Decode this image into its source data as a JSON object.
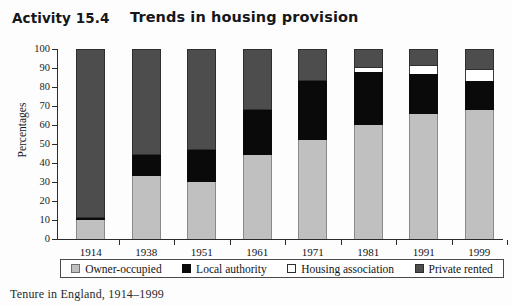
{
  "header": {
    "activity_label": "Activity 15.4",
    "title": "Trends in housing provision"
  },
  "caption": "Tenure in England, 1914–1999",
  "legend": {
    "items": [
      {
        "label": "Owner-occupied",
        "color": "#c0c0c0",
        "key": "owner"
      },
      {
        "label": "Local authority",
        "color": "#0a0a0a",
        "key": "local"
      },
      {
        "label": "Housing association",
        "color": "#ffffff",
        "key": "housing"
      },
      {
        "label": "Private rented",
        "color": "#4d4d4d",
        "key": "private"
      }
    ]
  },
  "chart_data": {
    "type": "bar",
    "stacked": true,
    "title": "Trends in housing provision",
    "xlabel": "",
    "ylabel": "Percentages",
    "ylim": [
      0,
      100
    ],
    "yticks": [
      0,
      10,
      20,
      30,
      40,
      50,
      60,
      70,
      80,
      90,
      100
    ],
    "grid": false,
    "legend_position": "bottom",
    "categories": [
      "1914",
      "1938",
      "1951",
      "1961",
      "1971",
      "1981",
      "1991",
      "1999"
    ],
    "series": [
      {
        "name": "Owner-occupied",
        "color": "#c0c0c0",
        "values": [
          10,
          33,
          30,
          44,
          52,
          60,
          66,
          68
        ]
      },
      {
        "name": "Local authority",
        "color": "#0a0a0a",
        "values": [
          1,
          11,
          17,
          24,
          31,
          28,
          21,
          15
        ]
      },
      {
        "name": "Housing association",
        "color": "#ffffff",
        "values": [
          0,
          0,
          0,
          0,
          0,
          2,
          4,
          6
        ]
      },
      {
        "name": "Private rented",
        "color": "#4d4d4d",
        "values": [
          89,
          56,
          53,
          32,
          17,
          10,
          9,
          11
        ]
      }
    ]
  }
}
